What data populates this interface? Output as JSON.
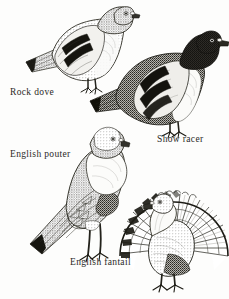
{
  "plate": {
    "title": "Pigeon breeds illustration plate",
    "background_color": "#fdfdfc",
    "ink_color": "#2b2a27",
    "style": "pen-and-ink stipple engraving",
    "width": 229,
    "height": 299
  },
  "figures": [
    {
      "id": "rock-dove",
      "caption": "Rock dove",
      "icon": "pigeon-rock-dove-icon",
      "orientation": "facing-right, perched horizontal",
      "markings": "two dark wing bars, pale grey body, dark tail tip, iridescent neck",
      "bbox": [
        22,
        2,
        118,
        98
      ],
      "caption_pos": [
        10,
        88
      ]
    },
    {
      "id": "show-racer",
      "caption": "Show racer",
      "icon": "pigeon-show-racer-icon",
      "orientation": "facing-right, perched horizontal, upright head",
      "markings": "dark stippled back and head, pale breast and wing shield, two bold wing bars",
      "bbox": [
        88,
        28,
        142,
        112
      ],
      "caption_pos": [
        157,
        135
      ]
    },
    {
      "id": "english-pouter",
      "caption": "English pouter",
      "icon": "pigeon-english-pouter-icon",
      "orientation": "standing tall, facing right, inflated crop",
      "markings": "long legs, inflated pale crop, long tapering tail with dark tip",
      "bbox": [
        28,
        122,
        112,
        148
      ],
      "caption_pos": [
        10,
        150
      ]
    },
    {
      "id": "english-fantail",
      "caption": "English fantail",
      "icon": "pigeon-english-fantail-icon",
      "orientation": "facing left, tail fanned fully upright",
      "markings": "large circular spread tail of banded feathers, small body, arched neck",
      "bbox": [
        112,
        182,
        118,
        118
      ],
      "caption_pos": [
        70,
        258
      ]
    }
  ]
}
